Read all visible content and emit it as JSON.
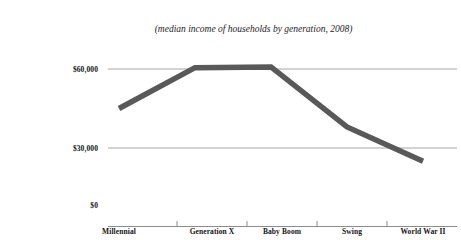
{
  "chart_data": {
    "type": "line",
    "title": "",
    "subtitle": "(median income of households by generation, 2008)",
    "categories": [
      "Millennial",
      "Generation X",
      "Baby Boom",
      "Swing",
      "World War II"
    ],
    "values": [
      45000,
      60500,
      60800,
      38000,
      25000
    ],
    "series": [
      {
        "name": "Median household income",
        "values": [
          45000,
          60500,
          60800,
          38000,
          25000
        ]
      }
    ],
    "xlabel": "",
    "ylabel": "",
    "ylim": [
      0,
      80000
    ],
    "yticks": [
      0,
      30000,
      60000
    ],
    "ytick_labels": [
      "$0",
      "$30,000",
      "$60,000"
    ],
    "grid": true,
    "legend": false,
    "line_color": "#595959",
    "gridline_color": "#a6a6a6",
    "axis_color": "#7f7f7f"
  },
  "axis": {
    "y_labels": [
      "$60,000",
      "$30,000",
      "$0"
    ],
    "x_labels": [
      "Millennial",
      "Generation X",
      "Baby Boom",
      "Swing",
      "World War II"
    ]
  }
}
